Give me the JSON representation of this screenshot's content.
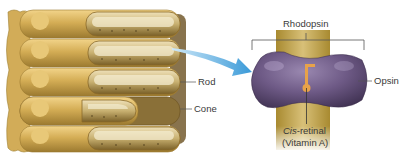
{
  "figure": {
    "left_panel": {
      "subject": "photoreceptor-cell-stack",
      "labels": {
        "rod": "Rod",
        "cone": "Cone"
      }
    },
    "right_panel": {
      "subject": "rhodopsin-molecule",
      "labels": {
        "rhodopsin": "Rhodopsin",
        "opsin": "Opsin",
        "cis_prefix": "Cis",
        "retinal_suffix": "-retinal",
        "vitamin": "(Vitamin A)"
      }
    },
    "colors": {
      "cell_gold": "#c9a24a",
      "cell_dark": "#8a6a2a",
      "membrane_band": "#b89a3c",
      "opsin_purple": "#6e5a86",
      "retinal_orange": "#e8a24a",
      "arrow_blue": "#5aaee0",
      "label_text": "#3a3a3a",
      "leader_line": "#555555"
    }
  }
}
